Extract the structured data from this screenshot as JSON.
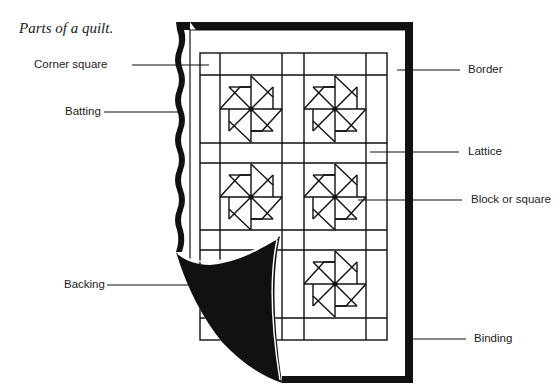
{
  "caption": "Parts of a quilt.",
  "labels": {
    "corner_square": "Corner square",
    "batting": "Batting",
    "backing": "Backing",
    "border": "Border",
    "lattice": "Lattice",
    "block": "Block or square",
    "binding": "Binding"
  },
  "colors": {
    "ink": "#111111",
    "paper": "#ffffff"
  }
}
